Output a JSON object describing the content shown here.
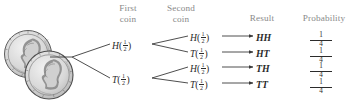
{
  "figure": {
    "kind": "probability-tree-diagram",
    "headers": {
      "first_coin_line1": "First",
      "first_coin_line2": "coin",
      "second_coin_line1": "Second",
      "second_coin_line2": "coin",
      "result": "Result",
      "probability": "Probability"
    },
    "icons": {
      "coins": "two-nickel-coins-icon"
    },
    "colors": {
      "ink": "#2b2b2b",
      "header_text": "#8a8a8a",
      "background": "#ffffff",
      "coin_fill": "#d9d9d9"
    },
    "first_level": [
      {
        "outcome": "H",
        "prob_num": "1",
        "prob_den": "2"
      },
      {
        "outcome": "T",
        "prob_num": "1",
        "prob_den": "2"
      }
    ],
    "second_level": [
      {
        "outcome": "H",
        "prob_num": "1",
        "prob_den": "2"
      },
      {
        "outcome": "T",
        "prob_num": "1",
        "prob_den": "2"
      },
      {
        "outcome": "H",
        "prob_num": "1",
        "prob_den": "2"
      },
      {
        "outcome": "T",
        "prob_num": "1",
        "prob_den": "2"
      }
    ],
    "results": [
      {
        "label": "HH",
        "prob_num": "1",
        "prob_den": "4"
      },
      {
        "label": "HT",
        "prob_num": "1",
        "prob_den": "4"
      },
      {
        "label": "TH",
        "prob_num": "1",
        "prob_den": "4"
      },
      {
        "label": "TT",
        "prob_num": "1",
        "prob_den": "4"
      }
    ]
  }
}
